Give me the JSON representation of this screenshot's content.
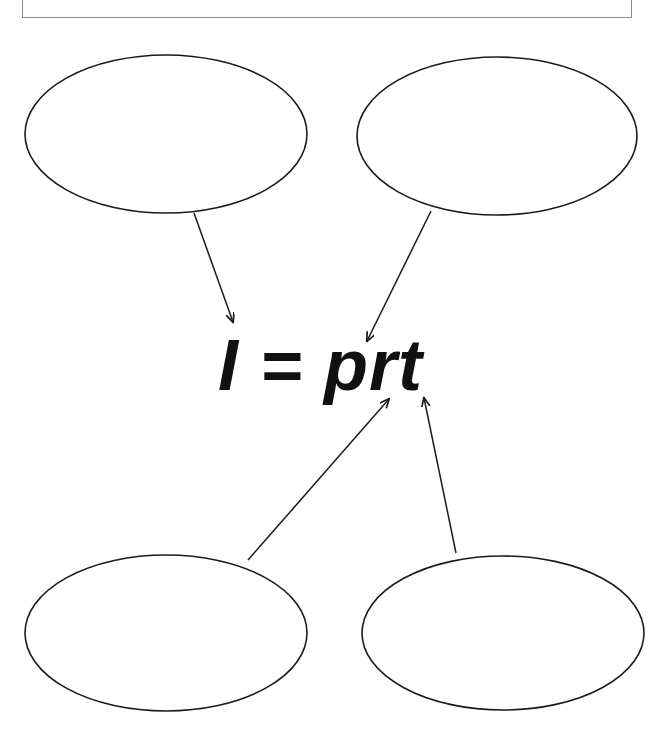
{
  "page": {
    "width": 657,
    "height": 736,
    "background_color": "#ffffff",
    "type": "concept-map-worksheet"
  },
  "title_box": {
    "text": "",
    "border_color": "#8a8a8a",
    "fill_color": "#ffffff"
  },
  "center_node": {
    "formula": "I = prt",
    "color": "#111111",
    "style": "bold-italic"
  },
  "ellipses": [
    {
      "id": "top-left",
      "label": "",
      "cx": 166,
      "cy": 134,
      "rx": 141,
      "ry": 79,
      "stroke": "#1a1a1a",
      "fill": "#ffffff"
    },
    {
      "id": "top-right",
      "label": "",
      "cx": 497,
      "cy": 136,
      "rx": 140,
      "ry": 79,
      "stroke": "#1a1a1a",
      "fill": "#ffffff"
    },
    {
      "id": "bottom-left",
      "label": "",
      "cx": 166,
      "cy": 633,
      "rx": 141,
      "ry": 78,
      "stroke": "#1a1a1a",
      "fill": "#ffffff"
    },
    {
      "id": "bottom-right",
      "label": "",
      "cx": 503,
      "cy": 633,
      "rx": 141,
      "ry": 77,
      "stroke": "#1a1a1a",
      "fill": "#ffffff"
    }
  ],
  "arrows": [
    {
      "id": "arrow-top-left-to-center",
      "from": "top-left",
      "to": "center_node",
      "x1": 194,
      "y1": 213,
      "x2": 233,
      "y2": 322,
      "stroke": "#1a1a1a"
    },
    {
      "id": "arrow-top-right-to-center",
      "from": "top-right",
      "to": "center_node",
      "x1": 431,
      "y1": 211,
      "x2": 367,
      "y2": 341,
      "stroke": "#1a1a1a"
    },
    {
      "id": "arrow-bottom-left-to-center",
      "from": "bottom-left",
      "to": "center_node",
      "x1": 248,
      "y1": 560,
      "x2": 389,
      "y2": 399,
      "stroke": "#1a1a1a"
    },
    {
      "id": "arrow-bottom-right-to-center",
      "from": "bottom-right",
      "to": "center_node",
      "x1": 456,
      "y1": 553,
      "x2": 424,
      "y2": 398,
      "stroke": "#1a1a1a"
    }
  ]
}
